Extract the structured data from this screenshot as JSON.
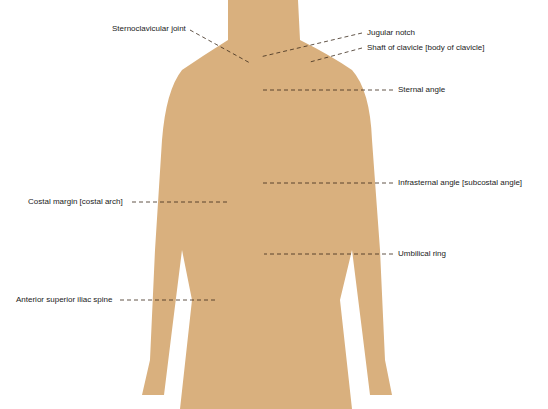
{
  "diagram": {
    "colors": {
      "silhouette": "#d9b07e",
      "silhouette_shade": "#c99b68",
      "leader": "#3a2a1a",
      "text": "#222222"
    },
    "labels": [
      {
        "id": "sternoclavicular-joint",
        "text": "Sternoclavicular joint",
        "x": 112,
        "y": 24
      },
      {
        "id": "jugular-notch",
        "text": "Jugular notch",
        "x": 367,
        "y": 30
      },
      {
        "id": "shaft-of-clavicle",
        "text": "Shaft of clavicle [body of clavicle]",
        "x": 367,
        "y": 45
      },
      {
        "id": "sternal-angle",
        "text": "Sternal angle",
        "x": 398,
        "y": 87
      },
      {
        "id": "infrasternal-angle",
        "text": "Infrasternal angle [subcostal angle]",
        "x": 398,
        "y": 180
      },
      {
        "id": "costal-margin",
        "text": "Costal margin [costal arch]",
        "x": 28,
        "y": 198
      },
      {
        "id": "umbilical-ring",
        "text": "Umbilical ring",
        "x": 398,
        "y": 250
      },
      {
        "id": "anterior-superior-iliac-spine",
        "text": "Anterior superior iliac spine",
        "x": 16,
        "y": 296
      }
    ]
  }
}
